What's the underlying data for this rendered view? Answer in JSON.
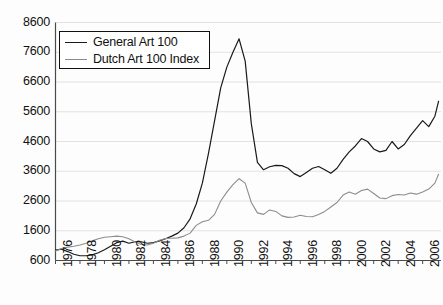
{
  "chart_data": {
    "type": "line",
    "title": "",
    "xlabel": "",
    "ylabel": "",
    "xlim": [
      1976,
      2007.5
    ],
    "ylim": [
      600,
      8600
    ],
    "grid": true,
    "grid_axis": "y",
    "legend_position": "top-left",
    "ytick_labels": [
      "8600",
      "7600",
      "6600",
      "5600",
      "4600",
      "3600",
      "2600",
      "1600",
      "600"
    ],
    "yticks": [
      8600,
      7600,
      6600,
      5600,
      4600,
      3600,
      2600,
      1600,
      600
    ],
    "xtick_labels": [
      "1976",
      "1978",
      "1980",
      "1982",
      "1984",
      "1986",
      "1988",
      "1990",
      "1992",
      "1994",
      "1996",
      "1998",
      "2000",
      "2002",
      "2004",
      "2006"
    ],
    "xticks": [
      1976,
      1978,
      1980,
      1982,
      1984,
      1986,
      1988,
      1990,
      1992,
      1994,
      1996,
      1998,
      2000,
      2002,
      2004,
      2006
    ],
    "series": [
      {
        "name": "General Art 100",
        "color": "#1a1a1a",
        "width": 1.2,
        "x": [
          1976.0,
          1976.5,
          1977.0,
          1977.5,
          1978.0,
          1978.5,
          1979.0,
          1979.5,
          1980.0,
          1980.5,
          1981.0,
          1981.5,
          1982.0,
          1982.5,
          1983.0,
          1983.5,
          1984.0,
          1984.5,
          1985.0,
          1985.5,
          1986.0,
          1986.5,
          1987.0,
          1987.5,
          1988.0,
          1988.5,
          1989.0,
          1989.5,
          1990.0,
          1990.5,
          1991.0,
          1991.5,
          1992.0,
          1992.5,
          1993.0,
          1993.5,
          1994.0,
          1994.5,
          1995.0,
          1995.5,
          1996.0,
          1996.5,
          1997.0,
          1997.5,
          1998.0,
          1998.5,
          1999.0,
          1999.5,
          2000.0,
          2000.5,
          2001.0,
          2001.5,
          2002.0,
          2002.5,
          2003.0,
          2003.5,
          2004.0,
          2004.5,
          2005.0,
          2005.5,
          2006.0,
          2006.5,
          2007.0,
          2007.3
        ],
        "y": [
          950,
          980,
          900,
          810,
          760,
          760,
          790,
          860,
          960,
          1080,
          1200,
          1250,
          1180,
          1230,
          1230,
          1180,
          1200,
          1260,
          1330,
          1420,
          1520,
          1700,
          2000,
          2500,
          3200,
          4200,
          5300,
          6400,
          7100,
          7600,
          8050,
          7300,
          5200,
          3900,
          3650,
          3750,
          3800,
          3790,
          3700,
          3520,
          3420,
          3560,
          3700,
          3760,
          3650,
          3530,
          3700,
          4000,
          4250,
          4450,
          4700,
          4600,
          4350,
          4250,
          4300,
          4600,
          4350,
          4500,
          4800,
          5050,
          5300,
          5100,
          5450,
          5950
        ]
      },
      {
        "name": "Dutch Art 100 Index",
        "color": "#8d8d8d",
        "width": 1.1,
        "x": [
          1976.0,
          1976.5,
          1977.0,
          1977.5,
          1978.0,
          1978.5,
          1979.0,
          1979.5,
          1980.0,
          1980.5,
          1981.0,
          1981.5,
          1982.0,
          1982.5,
          1983.0,
          1983.5,
          1984.0,
          1984.5,
          1985.0,
          1985.5,
          1986.0,
          1986.5,
          1987.0,
          1987.5,
          1988.0,
          1988.5,
          1989.0,
          1989.5,
          1990.0,
          1990.5,
          1991.0,
          1991.5,
          1992.0,
          1992.5,
          1993.0,
          1993.5,
          1994.0,
          1994.5,
          1995.0,
          1995.5,
          1996.0,
          1996.5,
          1997.0,
          1997.5,
          1998.0,
          1998.5,
          1999.0,
          1999.5,
          2000.0,
          2000.5,
          2001.0,
          2001.5,
          2002.0,
          2002.5,
          2003.0,
          2003.5,
          2004.0,
          2004.5,
          2005.0,
          2005.5,
          2006.0,
          2006.5,
          2007.0,
          2007.3
        ],
        "y": [
          920,
          1000,
          1050,
          1080,
          1120,
          1180,
          1260,
          1330,
          1380,
          1400,
          1420,
          1400,
          1330,
          1220,
          1140,
          1120,
          1180,
          1280,
          1340,
          1350,
          1360,
          1420,
          1520,
          1780,
          1900,
          1950,
          2150,
          2600,
          2900,
          3150,
          3350,
          3200,
          2550,
          2200,
          2150,
          2300,
          2250,
          2100,
          2050,
          2060,
          2120,
          2080,
          2070,
          2150,
          2250,
          2400,
          2550,
          2800,
          2900,
          2830,
          2950,
          3000,
          2850,
          2700,
          2680,
          2780,
          2820,
          2800,
          2870,
          2830,
          2900,
          3000,
          3200,
          3500
        ]
      }
    ]
  },
  "legend": {
    "items": [
      {
        "label": "General Art 100",
        "color": "#1a1a1a"
      },
      {
        "label": "Dutch Art 100 Index",
        "color": "#8d8d8d"
      }
    ]
  },
  "axes": {
    "axis_color": "#4a4a4a",
    "grid_color": "#e2e2e2",
    "text_color": "#111111"
  }
}
